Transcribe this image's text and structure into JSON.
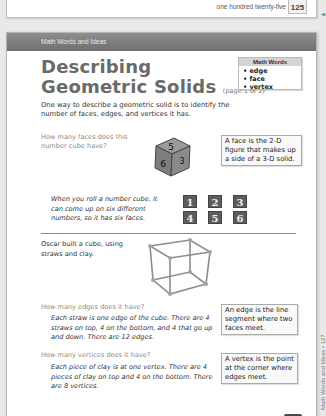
{
  "previous_page": {
    "footer_text": "one hundred twenty-five",
    "page_number": "125",
    "side_arrow": "◄"
  },
  "header": {
    "section_label": "Math Words and Ideas"
  },
  "title": {
    "main_line1": "Describing",
    "main_line2": "Geometric Solids",
    "subtitle": "(page 1 of 2)"
  },
  "vocab_box": {
    "heading": "Math Words",
    "items": [
      "• edge",
      "• face",
      "• vertex"
    ]
  },
  "intro": "One way to describe a geometric solid is to identify the number of faces, edges, and vertices it has.",
  "faces_section": {
    "question": "How many faces does this number cube have?",
    "die_numbers": {
      "top": "5",
      "front": "6",
      "side": "3"
    },
    "definition": "A face is the 2-D figure that makes up a side of a 3-D solid.",
    "answer": "When you roll a number cube, it can come up on six different numbers, so it has six faces.",
    "face_values": [
      "1",
      "2",
      "3",
      "4",
      "5",
      "6"
    ]
  },
  "cube_section": {
    "description": "Oscar built a cube, using straws and clay."
  },
  "edges_section": {
    "question": "How many edges does it have?",
    "answer": "Each straw is one edge of the cube. There are 4 straws on top, 4 on the bottom, and 4 that go up and down. There are 12 edges.",
    "definition": "An edge is the line segment where two faces meet."
  },
  "vertices_section": {
    "question": "How many vertices does it have?",
    "answer": "Each piece of clay is at one vertex. There are 4 pieces of clay on top and 4 on the bottom. There are 8 vertices.",
    "definition": "A vertex is the point at the corner where edges meet."
  },
  "side_margin_text": "Math Words and Ideas • 127",
  "colors": {
    "header_bar": "#7a7a7a",
    "title": "#6a6a6a",
    "question_text": "#8a8a8a",
    "face_tile": "#5d5d5d",
    "vocab_head": "#d4d4d4"
  }
}
